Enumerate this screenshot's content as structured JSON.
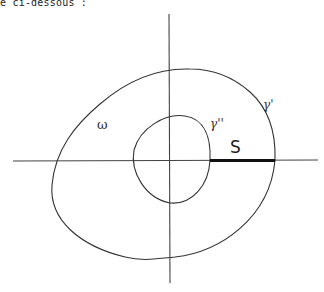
{
  "caption": "e ci-dessous :",
  "labels": {
    "omega": "ω",
    "gamma_prime": "γ'",
    "gamma_double_prime": "γ''",
    "segment": "S"
  },
  "colors": {
    "stroke": "#333333",
    "background": "#ffffff"
  }
}
